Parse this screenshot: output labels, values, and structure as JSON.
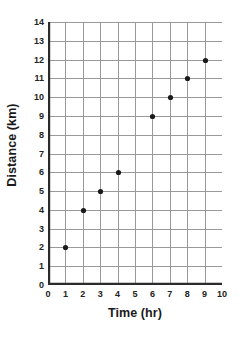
{
  "chart_data": {
    "type": "scatter",
    "title": "",
    "xlabel": "Time (hr)",
    "ylabel": "Distance (km)",
    "xlim": [
      0,
      10
    ],
    "ylim": [
      0,
      14
    ],
    "xticks": [
      "0",
      "1",
      "2",
      "3",
      "4",
      "5",
      "6",
      "7",
      "8",
      "9",
      "10"
    ],
    "yticks": [
      "0",
      "1",
      "2",
      "3",
      "4",
      "5",
      "6",
      "7",
      "8",
      "9",
      "10",
      "11",
      "12",
      "13",
      "14"
    ],
    "xtick_step": 1,
    "ytick_step": 1,
    "grid": true,
    "legend": "none",
    "series": [
      {
        "name": "Distance travelled",
        "marker": "filled-circle",
        "color": "#1a1a1a",
        "points": [
          {
            "x": 1,
            "y": 2
          },
          {
            "x": 2,
            "y": 4
          },
          {
            "x": 3,
            "y": 5
          },
          {
            "x": 4,
            "y": 6
          },
          {
            "x": 6,
            "y": 9
          },
          {
            "x": 7,
            "y": 10
          },
          {
            "x": 8,
            "y": 11
          },
          {
            "x": 9,
            "y": 12
          }
        ]
      }
    ]
  },
  "style": {
    "background": "#ffffff",
    "grid_color": "#9a9a9a",
    "axis_color": "#2b2b2b",
    "marker_color": "#141414",
    "tick_label_color": "#222222"
  }
}
